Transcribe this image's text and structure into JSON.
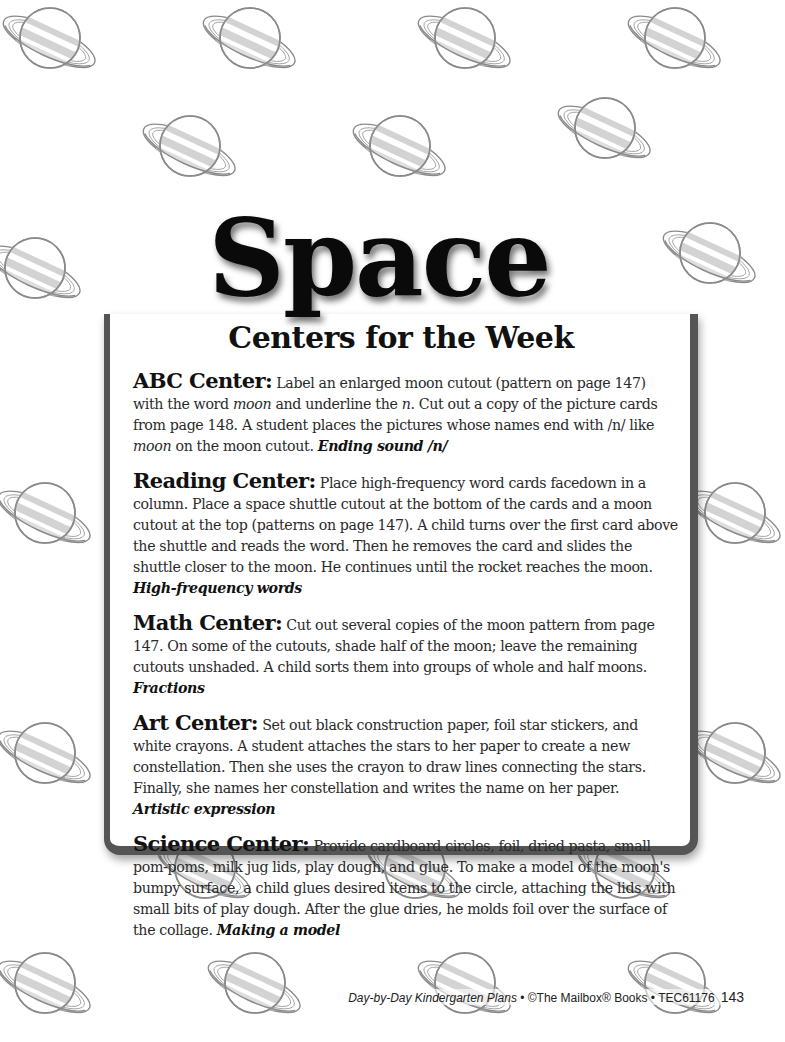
{
  "page": {
    "title": "Space",
    "subtitle": "Centers for the Week"
  },
  "centers": [
    {
      "name": "ABC Center:",
      "text_parts": [
        " Label an enlarged moon cutout (pattern on page 147) with the word ",
        "moon",
        " and underline the ",
        "n",
        ". Cut out a copy of the picture cards from page 148. A student places the pictures whose names end with /n/ like ",
        "moon",
        " on the moon cutout. "
      ],
      "skill": "Ending sound /n/"
    },
    {
      "name": "Reading Center:",
      "text": " Place high-frequency word cards facedown in a column. Place a space shuttle cutout at the bottom of the cards and a moon cutout at the top (patterns on page 147). A child turns over the first card above the shuttle and reads the word. Then he removes the card and slides the shuttle closer to the moon. He continues until the rocket reaches the moon. ",
      "skill": "High-frequency words"
    },
    {
      "name": "Math Center:",
      "text": " Cut out several copies of the moon pattern from page 147. On some of the cutouts, shade half of the moon; leave the remaining cutouts unshaded. A child sorts them into groups of whole and half moons. ",
      "skill": "Fractions"
    },
    {
      "name": "Art Center:",
      "text": " Set out black construction paper, foil star stickers, and white crayons. A student attaches the stars to her paper to create a new constellation. Then she uses the crayon to draw lines connecting the stars. Finally, she names her constellation and writes the name on her paper. ",
      "skill": "Artistic expression"
    },
    {
      "name": "Science Center:",
      "text": " Provide cardboard circles, foil, dried pasta, small pom-poms, milk jug lids, play dough, and glue. To make a model of the moon's bumpy surface, a child glues desired items to the circle, attaching the lids with small bits of play dough. After the glue dries, he molds foil over the surface of the collage. ",
      "skill": "Making a model"
    }
  ],
  "footer": {
    "book_title": "Day-by-Day Kindergarten Plans",
    "separator": " • ",
    "publisher": "©The Mailbox® Books",
    "code": "TEC61176",
    "page_number": "143"
  },
  "decoration": {
    "icon": "ringed-planet-icon",
    "colors": {
      "outline": "#8a8a8a",
      "band": "#c8c8c8",
      "frame": "#555555"
    }
  }
}
